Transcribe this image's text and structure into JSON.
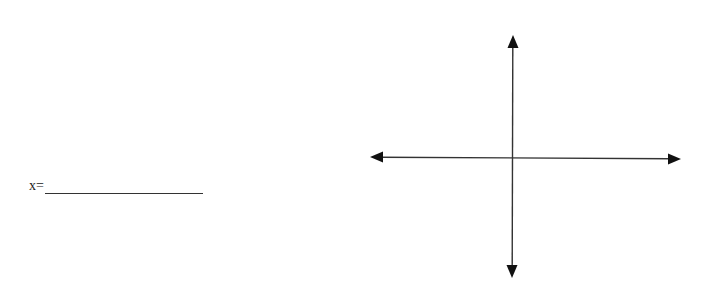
{
  "worksheet": {
    "answer_prompt": "x=",
    "answer_value": ""
  },
  "coordinate_plane": {
    "type": "blank-axes",
    "axis_color": "#222222",
    "horizontal_axis": {
      "x1": 370,
      "y1": 157,
      "x2": 681,
      "y2": 159
    },
    "vertical_axis": {
      "x1": 513,
      "y1": 35,
      "x2": 512,
      "y2": 278
    }
  }
}
